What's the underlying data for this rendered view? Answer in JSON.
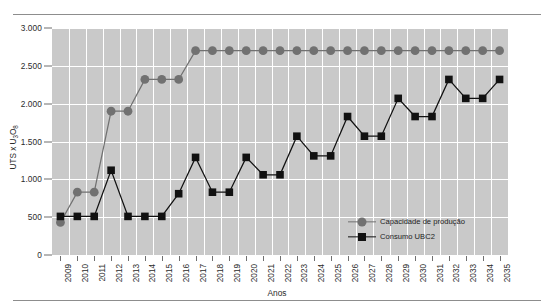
{
  "chart_data": {
    "type": "line",
    "title": "",
    "subtitle": "",
    "xlabel": "Anos",
    "ylabel": "UTS x U3O8",
    "ylabel_html": "UTS x U<sub>3</sub>O<sub>8</sub>",
    "ylim": [
      0,
      3000
    ],
    "yticks": [
      0,
      500,
      1000,
      1500,
      2000,
      2500,
      3000
    ],
    "ytick_labels": [
      "0",
      "500",
      "1.000",
      "1.500",
      "2.000",
      "2.500",
      "3.000"
    ],
    "grid": true,
    "grid_color": "#ffffff",
    "plot_background": "#c9c9c9",
    "legend_position": "inside-bottom-right",
    "categories": [
      "2009",
      "2010",
      "2011",
      "2012",
      "2013",
      "2014",
      "2015",
      "2016",
      "2017",
      "2018",
      "2019",
      "2020",
      "2021",
      "2022",
      "2023",
      "2024",
      "2025",
      "2026",
      "2027",
      "2028",
      "2029",
      "2030",
      "2031",
      "2032",
      "2033",
      "2034",
      "2035"
    ],
    "series": [
      {
        "name": "Capacidade de produção",
        "marker": "circle",
        "color": "#717171",
        "values": [
          430,
          830,
          830,
          1900,
          1900,
          2320,
          2320,
          2320,
          2700,
          2700,
          2700,
          2700,
          2700,
          2700,
          2700,
          2700,
          2700,
          2700,
          2700,
          2700,
          2700,
          2700,
          2700,
          2700,
          2700,
          2700,
          2700
        ]
      },
      {
        "name": "Consumo UBC2",
        "marker": "square",
        "color": "#111111",
        "values": [
          510,
          510,
          510,
          1120,
          510,
          510,
          510,
          810,
          1290,
          830,
          830,
          1290,
          1060,
          1060,
          1570,
          1310,
          1310,
          1830,
          1570,
          1570,
          2070,
          1830,
          1830,
          2320,
          2070,
          2070,
          2320
        ]
      }
    ]
  },
  "legend": {
    "items": [
      {
        "label": "Capacidade de produção",
        "marker": "circle",
        "color": "#717171"
      },
      {
        "label": "Consumo UBC2",
        "marker": "square",
        "color": "#111111"
      }
    ]
  }
}
